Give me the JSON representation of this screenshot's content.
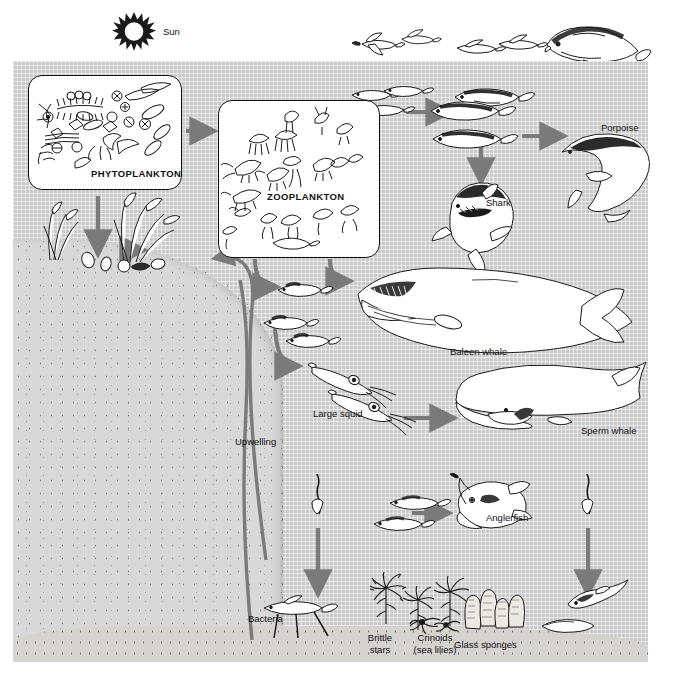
{
  "figure": {
    "type": "marine-food-web-diagram"
  },
  "sun": {
    "label": "Sun",
    "icon": "sun-icon"
  },
  "boxes": {
    "phytoplankton": {
      "label": "PHYTOPLANKTON"
    },
    "zooplankton": {
      "label": "ZOOPLANKTON"
    }
  },
  "labels": {
    "porpoise": "Porpoise",
    "shark": "Shark",
    "baleen_whale": "Baleen whale",
    "sperm_whale": "Sperm whale",
    "large_squid": "Large squid",
    "upwelling": "Upwelling",
    "anglerfish": "Anglerfish",
    "bacteria": "Bacteria",
    "brittle_stars_1": "Brittle",
    "brittle_stars_2": "stars",
    "crinoids_1": "Crinoids",
    "crinoids_2": "(sea lilies)",
    "glass_sponges": "Glass sponges"
  },
  "organisms": [
    {
      "name": "flying-fish",
      "label": "",
      "zone": "above-surface",
      "count": 2
    },
    {
      "name": "flying-fish-surface",
      "label": "",
      "zone": "surface",
      "count": 2
    },
    {
      "name": "dolphinfish",
      "label": "",
      "zone": "surface",
      "count": 1
    },
    {
      "name": "small-fish-school-upper",
      "label": "",
      "zone": "epipelagic",
      "count": 3
    },
    {
      "name": "mackerel",
      "label": "",
      "zone": "epipelagic",
      "count": 3
    },
    {
      "name": "shark",
      "label": "Shark",
      "zone": "epipelagic",
      "count": 1
    },
    {
      "name": "porpoise",
      "label": "Porpoise",
      "zone": "epipelagic",
      "count": 1
    },
    {
      "name": "baleen-whale",
      "label": "Baleen whale",
      "zone": "epipelagic",
      "count": 1
    },
    {
      "name": "small-fish-school-mid",
      "label": "",
      "zone": "mesopelagic",
      "count": 3
    },
    {
      "name": "large-squid",
      "label": "Large squid",
      "zone": "mesopelagic",
      "count": 2
    },
    {
      "name": "sperm-whale",
      "label": "Sperm whale",
      "zone": "mesopelagic",
      "count": 1
    },
    {
      "name": "lanternfish",
      "label": "",
      "zone": "bathypelagic",
      "count": 2
    },
    {
      "name": "anglerfish",
      "label": "Anglerfish",
      "zone": "bathypelagic",
      "count": 1
    },
    {
      "name": "detritus-falling",
      "label": "",
      "zone": "bathypelagic",
      "count": 2
    },
    {
      "name": "tripod-fish",
      "label": "Bacteria",
      "zone": "benthic",
      "count": 1
    },
    {
      "name": "brittle-stars",
      "label": "Brittle stars",
      "zone": "benthic",
      "count": 1
    },
    {
      "name": "crinoids",
      "label": "Crinoids (sea lilies)",
      "zone": "benthic",
      "count": 3
    },
    {
      "name": "glass-sponges",
      "label": "Glass sponges",
      "zone": "benthic",
      "count": 4
    },
    {
      "name": "rattail-fish",
      "label": "",
      "zone": "benthic",
      "count": 1
    },
    {
      "name": "sea-cucumber",
      "label": "",
      "zone": "benthic",
      "count": 1
    },
    {
      "name": "kelp",
      "label": "",
      "zone": "shelf",
      "count": 2
    },
    {
      "name": "shellfish",
      "label": "",
      "zone": "shelf",
      "count": 5
    }
  ],
  "flows": [
    {
      "from": "PHYTOPLANKTON",
      "to": "ZOOPLANKTON"
    },
    {
      "from": "PHYTOPLANKTON",
      "to": "shelf-benthos"
    },
    {
      "from": "ZOOPLANKTON",
      "to": "small-fish-upper"
    },
    {
      "from": "small-fish-upper",
      "to": "mackerel"
    },
    {
      "from": "mackerel",
      "to": "shark"
    },
    {
      "from": "mackerel",
      "to": "porpoise"
    },
    {
      "from": "ZOOPLANKTON",
      "to": "baleen-whale"
    },
    {
      "from": "ZOOPLANKTON",
      "to": "small-fish-mid"
    },
    {
      "from": "small-fish-mid",
      "to": "large-squid"
    },
    {
      "from": "large-squid",
      "to": "sperm-whale"
    },
    {
      "from": "lanternfish",
      "to": "anglerfish"
    },
    {
      "from": "detritus",
      "to": "benthic-floor"
    },
    {
      "from": "upwelling",
      "to": "shelf-kelp"
    }
  ],
  "colors": {
    "water": "#c9c9c9",
    "slope": "#d8d8d8",
    "floor": "#d5d3cf",
    "arrow": "#7a7a7a",
    "ink": "#111111",
    "box": "#ffffff"
  }
}
